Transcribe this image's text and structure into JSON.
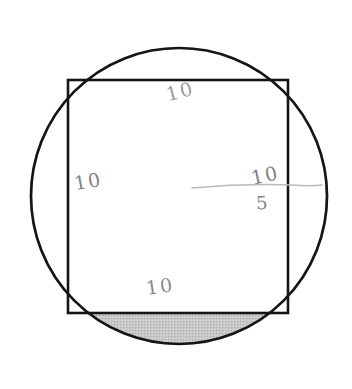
{
  "figure": {
    "background_color": "#ffffff",
    "stroke_color": "#1a1a1a",
    "shade_color": "#c5c5c5",
    "pencil_color": "#8a8a8d"
  },
  "shapes": {
    "circle": {
      "name": "circumscribed-circle",
      "center_x": 179,
      "center_y": 196,
      "radius": 149,
      "stroke_width": 2.6
    },
    "square": {
      "name": "inscribed-square",
      "left": 68,
      "top": 80,
      "width": 220,
      "height": 233,
      "stroke_width": 2.6
    },
    "segment": {
      "name": "shaded-circular-segment",
      "chord_y": 313,
      "fill": "#c5c5c5"
    },
    "pencil_line": {
      "name": "freehand-horizontal-line",
      "x1": 192,
      "y1": 187,
      "x2": 322,
      "y2": 185
    }
  },
  "labels": {
    "top": "10",
    "left": "10",
    "bottom": "10",
    "fraction_numerator": "10",
    "fraction_denominator": "5"
  }
}
